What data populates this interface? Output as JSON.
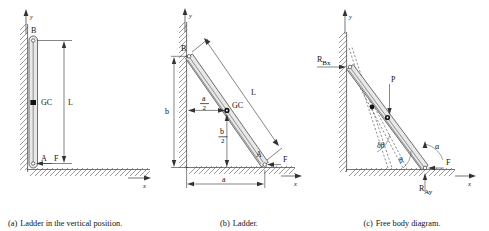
{
  "figure": {
    "panels": [
      {
        "id": "a",
        "caption_tag": "(a)",
        "caption_text": "Ladder in the vertical position.",
        "axis": {
          "x": "x",
          "y": "y"
        },
        "labels": {
          "top_point": "B",
          "bottom_point": "A",
          "centroid": "GC",
          "length": "L",
          "force": "F"
        }
      },
      {
        "id": "b",
        "caption_tag": "(b)",
        "caption_text": "Ladder.",
        "axis": {
          "x": "x",
          "y": "y"
        },
        "labels": {
          "top_point": "B",
          "bottom_point": "A",
          "centroid": "GC",
          "length": "L",
          "force": "F",
          "horizontal_span": "a",
          "vertical_span": "b",
          "half_horizontal_num": "a",
          "half_horizontal_den": "2",
          "half_vertical_num": "b",
          "half_vertical_den": "2"
        }
      },
      {
        "id": "c",
        "caption_tag": "(c)",
        "caption_text": "Free body diagram.",
        "axis": {
          "x": "x",
          "y": "y"
        },
        "labels": {
          "reaction_wall": "R",
          "reaction_wall_sub": "Bx",
          "reaction_ground": "R",
          "reaction_ground_sub": "Ay",
          "load": "P",
          "friction": "F",
          "angle_alpha": "α",
          "angle_theta": "θ",
          "angle_delta_theta": "δθ"
        }
      }
    ]
  },
  "colors": {
    "ink": "#111111",
    "line": "#333333",
    "body_fill": "#e8e8e8",
    "hatch": "#4a4a4a",
    "background": "#ffffff"
  }
}
